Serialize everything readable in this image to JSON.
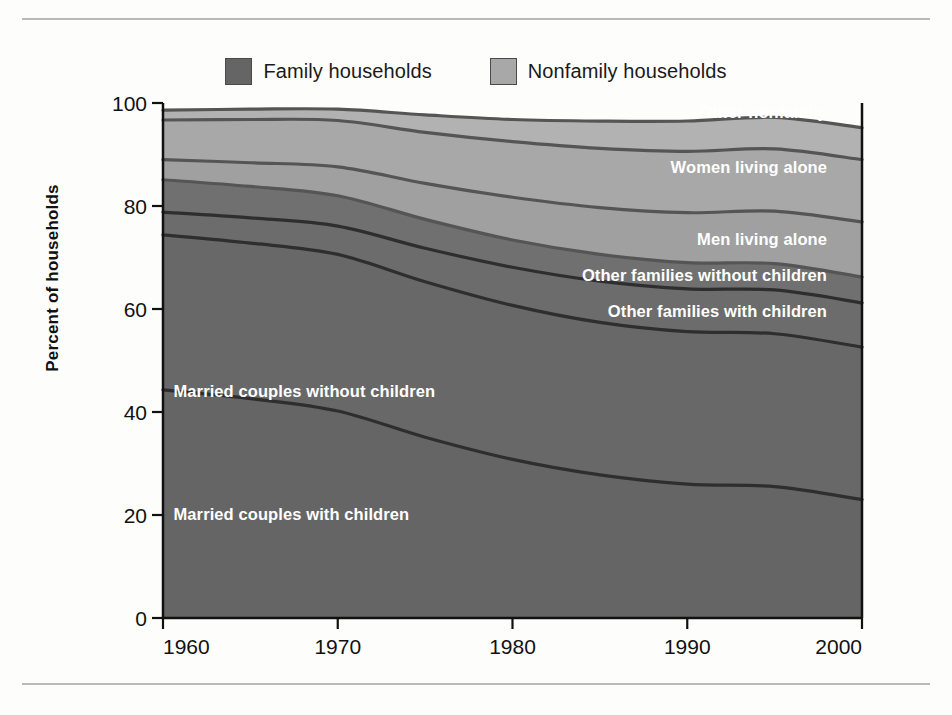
{
  "legend": {
    "items": [
      {
        "label": "Family households",
        "color": "#656565",
        "name": "family-households"
      },
      {
        "label": "Nonfamily households",
        "color": "#a8a8a8",
        "name": "nonfamily-households"
      }
    ]
  },
  "chart_data": {
    "type": "area",
    "title": "",
    "xlabel": "",
    "ylabel": "Percent of households",
    "xlim": [
      1960,
      2000
    ],
    "ylim": [
      0,
      100
    ],
    "yticks": [
      0,
      20,
      40,
      60,
      80,
      100
    ],
    "xticks": [
      1960,
      1970,
      1980,
      1990,
      2000
    ],
    "xtick_labels": [
      "1960",
      "1970",
      "1980",
      "1990",
      "2000"
    ],
    "ytick_labels": [
      "0",
      "20",
      "40",
      "60",
      "80",
      "100"
    ],
    "grid": false,
    "legend_position": "top-center",
    "stacked": true,
    "x": [
      1960,
      1965,
      1970,
      1975,
      1980,
      1985,
      1990,
      1995,
      2000
    ],
    "series": [
      {
        "name": "Married couples with children",
        "group": "Family households",
        "color": "#656565",
        "values": [
          44.3,
          42.6,
          40.2,
          35.1,
          30.8,
          27.8,
          26.0,
          25.5,
          23.0
        ]
      },
      {
        "name": "Married couples without children",
        "group": "Family households",
        "color": "#686868",
        "values": [
          30.1,
          30.2,
          30.4,
          30.2,
          29.9,
          29.6,
          29.6,
          29.7,
          29.6
        ]
      },
      {
        "name": "Other families with children",
        "group": "Family households",
        "color": "#6c6c6c",
        "values": [
          4.4,
          4.9,
          5.5,
          6.5,
          7.4,
          8.0,
          8.3,
          8.5,
          8.6
        ]
      },
      {
        "name": "Other families without children",
        "group": "Family households",
        "color": "#707070",
        "values": [
          6.3,
          6.1,
          5.9,
          5.6,
          5.3,
          5.2,
          5.1,
          5.1,
          5.0
        ]
      },
      {
        "name": "Men living alone",
        "group": "Nonfamily households",
        "color": "#a0a0a0",
        "values": [
          3.9,
          4.6,
          5.6,
          7.0,
          8.3,
          9.1,
          9.7,
          10.2,
          10.7
        ]
      },
      {
        "name": "Women living alone",
        "group": "Nonfamily households",
        "color": "#a8a8a8",
        "values": [
          7.7,
          8.4,
          9.0,
          9.9,
          10.8,
          11.5,
          11.9,
          12.1,
          12.1
        ]
      },
      {
        "name": "Other nonfamily",
        "group": "Nonfamily households",
        "color": "#b2b2b2",
        "values": [
          1.9,
          2.0,
          2.2,
          3.4,
          4.3,
          5.3,
          5.9,
          6.1,
          6.2
        ]
      }
    ],
    "boundaries_top_of_band": {
      "Married couples with children": [
        44.3,
        42.6,
        45.2,
        40.0,
        36.9,
        34.0,
        36.1,
        24.5,
        22.9
      ],
      "cumulative_1960": [
        44.3,
        74.4,
        78.8,
        85.1,
        89.0,
        96.7,
        98.6
      ],
      "cumulative_2000": [
        22.9,
        52.5,
        61.1,
        66.1,
        76.8,
        88.9,
        95.1
      ]
    },
    "band_labels": [
      {
        "text": "Other nonfamily",
        "anchor": "end",
        "x": 1998,
        "y": 97.0
      },
      {
        "text": "Women living alone",
        "anchor": "end",
        "x": 1998,
        "y": 86.5
      },
      {
        "text": "Men living alone",
        "anchor": "end",
        "x": 1998,
        "y": 72.5
      },
      {
        "text": "Other families without children",
        "anchor": "end",
        "x": 1998,
        "y": 65.5
      },
      {
        "text": "Other families with children",
        "anchor": "end",
        "x": 1998,
        "y": 58.5
      },
      {
        "text": "Married couples without children",
        "anchor": "start",
        "x": 1960.6,
        "y": 43.0
      },
      {
        "text": "Married couples with children",
        "anchor": "start",
        "x": 1960.6,
        "y": 19.0
      }
    ]
  }
}
